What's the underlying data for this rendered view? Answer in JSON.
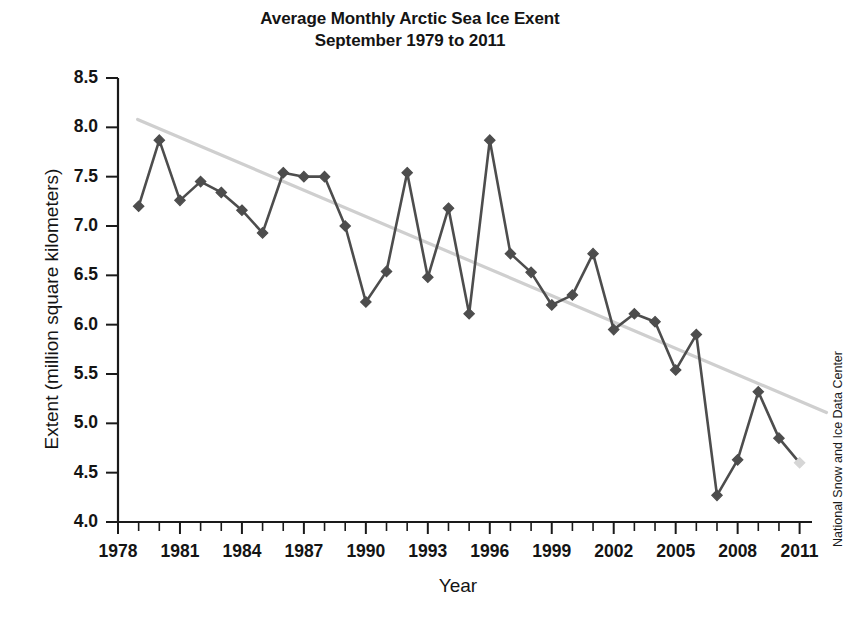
{
  "chart_data": {
    "type": "line",
    "title": "Average Monthly Arctic Sea Ice Exent",
    "subtitle": "September 1979 to 2011",
    "title_lines": [
      "Average Monthly Arctic Sea Ice Exent",
      "September 1979 to 2011"
    ],
    "xlabel": "Year",
    "ylabel": "Extent (million square kilometers)",
    "credit": "National Snow and Ice Data Center",
    "xlim": [
      1978,
      2011.6
    ],
    "ylim": [
      4.0,
      8.5
    ],
    "grid": false,
    "legend": "none",
    "x_tick_labels": [
      "1978",
      "1981",
      "1984",
      "1987",
      "1990",
      "1993",
      "1996",
      "1999",
      "2002",
      "2005",
      "2008",
      "2011"
    ],
    "x_tick_values": [
      1978,
      1981,
      1984,
      1987,
      1990,
      1993,
      1996,
      1999,
      2002,
      2005,
      2008,
      2011
    ],
    "x_minor_tick_step": 1,
    "y_tick_labels": [
      "4.0",
      "4.5",
      "5.0",
      "5.5",
      "6.0",
      "6.5",
      "7.0",
      "7.5",
      "8.0",
      "8.5"
    ],
    "y_tick_values": [
      4.0,
      4.5,
      5.0,
      5.5,
      6.0,
      6.5,
      7.0,
      7.5,
      8.0,
      8.5
    ],
    "series": [
      {
        "name": "September Arctic sea ice extent",
        "marker": "diamond",
        "color": "#4d4d4d",
        "x": [
          1979,
          1980,
          1981,
          1982,
          1983,
          1984,
          1985,
          1986,
          1987,
          1988,
          1989,
          1990,
          1991,
          1992,
          1993,
          1994,
          1995,
          1996,
          1997,
          1998,
          1999,
          2000,
          2001,
          2002,
          2003,
          2004,
          2005,
          2006,
          2007,
          2008,
          2009,
          2010,
          2011
        ],
        "values": [
          7.2,
          7.87,
          7.26,
          7.45,
          7.34,
          7.16,
          6.93,
          7.54,
          7.5,
          7.5,
          7.0,
          6.23,
          6.54,
          7.54,
          6.48,
          7.18,
          6.11,
          7.87,
          6.72,
          6.53,
          6.2,
          6.3,
          6.72,
          5.95,
          6.11,
          6.03,
          5.54,
          5.9,
          4.27,
          4.63,
          5.32,
          4.85,
          4.6
        ]
      }
    ],
    "trendline": {
      "name": "linear trend",
      "color": "#cfcfcf",
      "x_start": 1978.95,
      "y_start": 8.08,
      "x_end": 2012.3,
      "y_end": 5.11
    }
  }
}
